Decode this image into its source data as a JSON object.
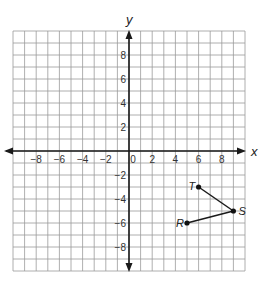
{
  "figure": {
    "x_axis_label": "x",
    "y_axis_label": "y",
    "x_range": [
      -10,
      10
    ],
    "y_range": [
      -10,
      10
    ],
    "grid_step": 1,
    "x_tick_labels": [
      "-8",
      "-6",
      "-4",
      "-2",
      "0",
      "2",
      "4",
      "6",
      "8"
    ],
    "y_tick_labels_positive": [
      "8",
      "6",
      "4",
      "2"
    ],
    "y_tick_labels_negative": [
      "-2",
      "-4",
      "-6",
      "-8"
    ],
    "points": [
      {
        "label": "T",
        "x": 6,
        "y": -3
      },
      {
        "label": "S",
        "x": 9,
        "y": -5
      },
      {
        "label": "R",
        "x": 5,
        "y": -6
      }
    ],
    "segments": [
      [
        "T",
        "S"
      ],
      [
        "S",
        "R"
      ]
    ],
    "colors": {
      "grid": "#9a9a9a",
      "axis": "#1a1a1a",
      "segment": "#1a1a1a",
      "point": "#111111"
    }
  },
  "chart_data": {
    "type": "scatter",
    "title": "",
    "xlabel": "x",
    "ylabel": "y",
    "xlim": [
      -10,
      10
    ],
    "ylim": [
      -10,
      10
    ],
    "grid": true,
    "series": [
      {
        "name": "path T-S-R",
        "x": [
          6,
          9,
          5
        ],
        "y": [
          -3,
          -5,
          -6
        ],
        "labels": [
          "T",
          "S",
          "R"
        ],
        "connected": true
      }
    ]
  }
}
